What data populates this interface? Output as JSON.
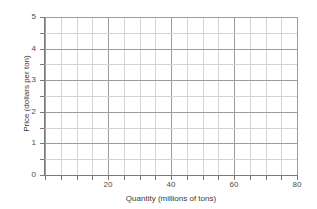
{
  "chart_data": {
    "type": "line",
    "title": "",
    "xlabel": "Quantity (millions of tons)",
    "ylabel": "Price (dollars per ton)",
    "xlim": [
      0,
      80
    ],
    "ylim": [
      0,
      5
    ],
    "x_major_ticks": [
      0,
      20,
      40,
      60,
      80
    ],
    "x_major_tick_labels": [
      "",
      "20",
      "40",
      "60",
      "80"
    ],
    "x_minor_tick_step": 5,
    "y_major_ticks": [
      0,
      1,
      2,
      3,
      4,
      5
    ],
    "y_major_tick_labels": [
      "0",
      "1",
      "2",
      "3",
      "4",
      "5"
    ],
    "y_minor_tick_step": 0.5,
    "grid": true,
    "grid_major_color": "#9c9c9c",
    "grid_minor_color": "#d3d3d3",
    "legend": false,
    "series": [],
    "x": [],
    "values": [],
    "annotations": [],
    "note": "Empty graph grid with no plotted data"
  },
  "axes": {
    "x_title": "Quantity (millions of tons)",
    "y_title": "Price (dollars per ton)",
    "x_tick_labels": [
      {
        "value": 20,
        "label": "20"
      },
      {
        "value": 40,
        "label": "40"
      },
      {
        "value": 60,
        "label": "60"
      },
      {
        "value": 80,
        "label": "80"
      }
    ],
    "y_tick_labels": [
      {
        "value": 5,
        "label": "5"
      },
      {
        "value": 4,
        "label": "4"
      },
      {
        "value": 3,
        "label": "3"
      },
      {
        "value": 2,
        "label": "2"
      },
      {
        "value": 1,
        "label": "1"
      },
      {
        "value": 0,
        "label": "0"
      }
    ]
  },
  "colors": {
    "background": "#ffffff",
    "axis": "#7a7a7a",
    "grid_major": "#9c9c9c",
    "grid_minor": "#d3d3d3",
    "text": "#3a3a3a"
  }
}
